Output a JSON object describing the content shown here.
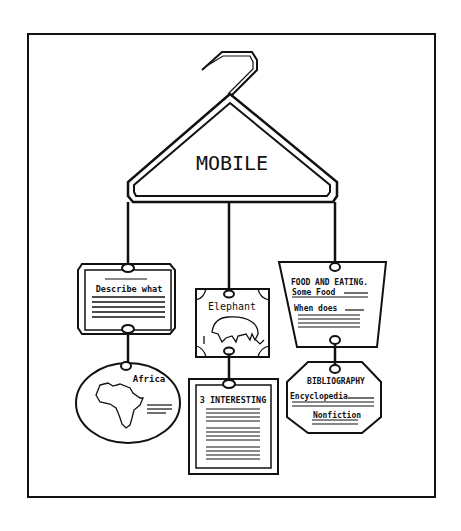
{
  "title": "MOBILE",
  "cards": {
    "describe": {
      "label": "Describe what",
      "lines": 5
    },
    "africa": {
      "label": "Africa",
      "lines": 3
    },
    "elephant": {
      "label": "Elephant"
    },
    "interesting": {
      "label": "3 INTERESTING",
      "lines": 12
    },
    "food": {
      "label": "FOOD AND EATING.",
      "line1": "Some Food",
      "line2": "When does",
      "lines": 4
    },
    "bibliography": {
      "label": "BIBLIOGRAPHY",
      "line1": "Encyclopedia",
      "line2": "Nonfiction",
      "lines": 3
    }
  },
  "colors": {
    "ink": "#111111",
    "paper": "#ffffff"
  }
}
